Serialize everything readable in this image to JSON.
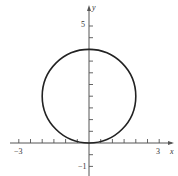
{
  "chart_data": {
    "type": "line",
    "title": "",
    "xlabel": "x",
    "ylabel": "y",
    "xlim": [
      -3.2,
      3.5
    ],
    "ylim": [
      -1.2,
      5.5
    ],
    "grid": false,
    "x_tick_step": 0.5,
    "y_tick_step": 0.5,
    "x_tick_labels": [
      {
        "value": -3,
        "label": "−3"
      },
      {
        "value": 3,
        "label": "3"
      }
    ],
    "y_tick_labels": [
      {
        "value": 5,
        "label": "5"
      },
      {
        "value": -1,
        "label": "−1"
      }
    ],
    "series": [
      {
        "name": "circle",
        "shape": "circle",
        "center": [
          0,
          2
        ],
        "radius": 2,
        "equation": "x^2 + (y-2)^2 = 4",
        "color": "#222222"
      }
    ]
  },
  "labels": {
    "x_axis": "x",
    "y_axis": "y",
    "x_min_label": "−3",
    "x_max_label": "3",
    "y_max_label": "5",
    "y_min_label": "−1"
  },
  "colors": {
    "axis": "#555555",
    "curve": "#222222"
  }
}
